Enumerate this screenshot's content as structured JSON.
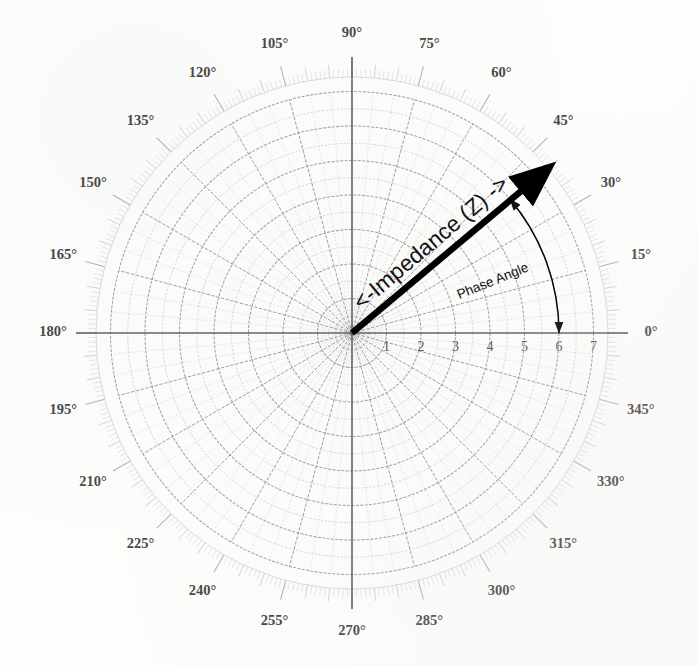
{
  "chart_data": {
    "type": "polar-scatter",
    "title": "",
    "subtitle": "",
    "xlabel": "",
    "ylabel": "",
    "grid": true,
    "legend_position": "none",
    "projection": "polar",
    "angular_axis": {
      "unit": "degrees",
      "direction": "counterclockwise",
      "zero_location": "E",
      "range": [
        0,
        360
      ],
      "major_tick_step": 15,
      "minor_tick_step": 1,
      "intermediate_tick_step": 5,
      "spoke_count": 24,
      "tick_labels": [
        "0°",
        "15°",
        "30°",
        "45°",
        "60°",
        "75°",
        "90°",
        "105°",
        "120°",
        "135°",
        "150°",
        "165°",
        "180°",
        "195°",
        "210°",
        "225°",
        "240°",
        "255°",
        "270°",
        "285°",
        "300°",
        "315°",
        "330°",
        "345°"
      ],
      "tick_values": [
        0,
        15,
        30,
        45,
        60,
        75,
        90,
        105,
        120,
        135,
        150,
        165,
        180,
        195,
        210,
        225,
        240,
        255,
        270,
        285,
        300,
        315,
        330,
        345
      ]
    },
    "radial_axis": {
      "range": [
        0,
        7
      ],
      "tick_labels": [
        "1",
        "2",
        "3",
        "4",
        "5",
        "6",
        "7"
      ],
      "tick_values": [
        1,
        2,
        3,
        4,
        5,
        6,
        7
      ],
      "label_angle_deg": 0,
      "minor_rings_per_unit": 2
    },
    "vectors": [
      {
        "name": "impedance",
        "label": "<-Impedance (Z) ->",
        "angle_deg": 40,
        "magnitude": 6.6,
        "color": "#000000",
        "style": "thick-arrow",
        "label_rotation_deg": -40
      }
    ],
    "arcs": [
      {
        "name": "phase-angle",
        "label": "Phase Angle",
        "start_angle_deg": 0,
        "end_angle_deg": 40,
        "radius": 6.0,
        "color": "#000000",
        "style": "double-headed-curved-arrow",
        "label_rotation_deg": -22
      }
    ]
  },
  "annotations": {
    "impedance_label": "<-Impedance (Z) ->",
    "phase_angle_label": "Phase Angle"
  },
  "colors": {
    "paper": "#fdfdfc",
    "grid_major": "#8e8e92",
    "grid_minor": "#b9b9bd",
    "axis": "#5c5c60",
    "tick_ring": "#a9a9ae",
    "ink": "#000000",
    "label_text": "#4a4a4a"
  },
  "geometry": {
    "center_x": 352,
    "center_y": 333,
    "outer_radius_px": 276,
    "unit_radius_px": 34.5
  }
}
